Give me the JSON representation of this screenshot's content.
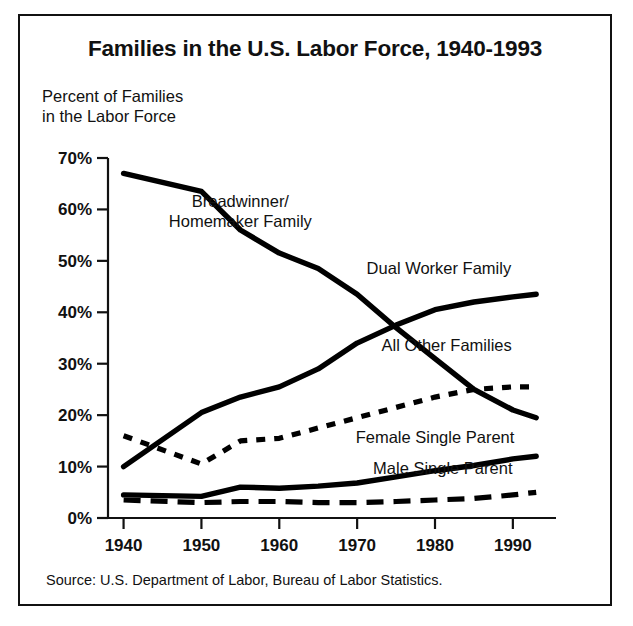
{
  "figure": {
    "title": "Families in the U.S. Labor Force, 1940-1993",
    "y_axis_caption_line1": "Percent of Families",
    "y_axis_caption_line2": "in the Labor Force",
    "source": "Source: U.S. Department of Labor, Bureau of Labor Statistics.",
    "frame_color": "#111111",
    "line_color": "#000000",
    "background": "#ffffff"
  },
  "chart_data": {
    "type": "line",
    "title": "Families in the U.S. Labor Force, 1940-1993",
    "xlabel": "",
    "ylabel": "Percent of Families in the Labor Force",
    "xlim": [
      1938,
      1994
    ],
    "ylim": [
      0,
      70
    ],
    "xticks": [
      1940,
      1950,
      1960,
      1970,
      1980,
      1990
    ],
    "xtick_labels": [
      "1940",
      "1950",
      "1960",
      "1970",
      "1980",
      "1990"
    ],
    "yticks": [
      0,
      10,
      20,
      30,
      40,
      50,
      60,
      70
    ],
    "ytick_labels": [
      "0%",
      "10%",
      "20%",
      "30%",
      "40%",
      "50%",
      "60%",
      "70%"
    ],
    "grid": false,
    "legend": "inline-labels",
    "series": [
      {
        "name": "Breadwinner/Homemaker Family",
        "label_line1": "Breadwinner/",
        "label_line2": "Homemaker Family",
        "style": "solid",
        "x": [
          1940,
          1950,
          1955,
          1960,
          1965,
          1970,
          1975,
          1980,
          1985,
          1990,
          1993
        ],
        "values": [
          67.0,
          63.5,
          56.0,
          51.5,
          48.5,
          43.5,
          37.0,
          31.0,
          25.0,
          21.0,
          19.5
        ]
      },
      {
        "name": "Dual Worker Family",
        "label_line1": "Dual Worker Family",
        "style": "solid",
        "x": [
          1940,
          1950,
          1955,
          1960,
          1965,
          1970,
          1975,
          1980,
          1985,
          1990,
          1993
        ],
        "values": [
          10.0,
          20.5,
          23.5,
          25.5,
          29.0,
          34.0,
          37.5,
          40.5,
          42.0,
          43.0,
          43.5
        ]
      },
      {
        "name": "All Other Families",
        "label_line1": "All Other Families",
        "style": "dotted",
        "x": [
          1940,
          1950,
          1955,
          1960,
          1965,
          1970,
          1975,
          1980,
          1985,
          1990,
          1993
        ],
        "values": [
          16.0,
          10.5,
          15.0,
          15.5,
          17.5,
          19.5,
          21.5,
          23.5,
          25.0,
          25.5,
          25.5
        ]
      },
      {
        "name": "Female Single Parent",
        "label_line1": "Female Single Parent",
        "style": "solid",
        "x": [
          1940,
          1950,
          1955,
          1960,
          1965,
          1970,
          1975,
          1980,
          1985,
          1990,
          1993
        ],
        "values": [
          4.5,
          4.2,
          6.0,
          5.8,
          6.2,
          6.8,
          8.0,
          9.2,
          10.2,
          11.5,
          12.0
        ]
      },
      {
        "name": "Male Single Parent",
        "label_line1": "Male Single Parent",
        "style": "dashed",
        "x": [
          1940,
          1950,
          1955,
          1960,
          1965,
          1970,
          1975,
          1980,
          1985,
          1990,
          1993
        ],
        "values": [
          3.5,
          3.0,
          3.2,
          3.2,
          3.0,
          3.0,
          3.2,
          3.5,
          3.8,
          4.5,
          5.0
        ]
      }
    ],
    "annotations": [
      {
        "text": "Breadwinner/",
        "x": 1955.0,
        "y": 60.5
      },
      {
        "text": "Homemaker Family",
        "x": 1955.0,
        "y": 56.5
      },
      {
        "text": "Dual Worker Family",
        "x": 1980.5,
        "y": 47.5
      },
      {
        "text": "All Other Families",
        "x": 1981.5,
        "y": 32.5
      },
      {
        "text": "Female Single Parent",
        "x": 1980.0,
        "y": 14.5
      },
      {
        "text": "Male Single Parent",
        "x": 1981.0,
        "y": 8.5
      }
    ]
  }
}
